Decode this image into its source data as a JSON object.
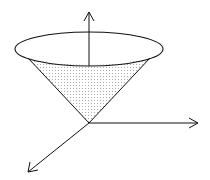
{
  "diagram": {
    "title": "",
    "colors": {
      "stroke": "#111111",
      "fill": "#ffffff",
      "dots": "#555555"
    },
    "elements": [
      "cone-rim-ellipse",
      "cone-shaded-surface",
      "z-axis",
      "x-axis",
      "y-axis"
    ]
  }
}
